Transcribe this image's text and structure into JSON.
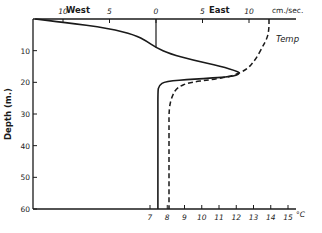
{
  "chart_data": {
    "type": "line",
    "title": "",
    "ylabel": "Depth (m.)",
    "ylim": [
      0,
      60
    ],
    "y_ticks": [
      10,
      20,
      30,
      40,
      50,
      60
    ],
    "top_axis": {
      "label_left": "West",
      "label_right": "East",
      "units": "cm./sec.",
      "ticks": [
        {
          "value": -10,
          "label": "10"
        },
        {
          "value": -5,
          "label": "5"
        },
        {
          "value": 0,
          "label": "0"
        },
        {
          "value": 5,
          "label": "5"
        },
        {
          "value": 10,
          "label": "10"
        }
      ],
      "range": [
        -13,
        15
      ]
    },
    "bottom_axis": {
      "units": "°C",
      "ticks": [
        7,
        8,
        9,
        10,
        11,
        12,
        13,
        14,
        15
      ],
      "range": [
        6.65,
        15.2
      ]
    },
    "series": [
      {
        "name": "Velocity",
        "axis": "top",
        "style": "solid",
        "points": [
          [
            -13.0,
            0
          ],
          [
            -10.0,
            1
          ],
          [
            -5.0,
            3
          ],
          [
            -2.3,
            5
          ],
          [
            -1.0,
            7
          ],
          [
            0.0,
            9
          ],
          [
            1.5,
            11
          ],
          [
            4.0,
            13
          ],
          [
            7.0,
            15
          ],
          [
            8.8,
            16.5
          ],
          [
            9.0,
            17.3
          ],
          [
            8.2,
            18.2
          ],
          [
            4.0,
            19
          ],
          [
            1.0,
            19.7
          ],
          [
            0.3,
            21
          ],
          [
            0.2,
            23
          ],
          [
            0.2,
            30
          ],
          [
            0.2,
            60
          ]
        ]
      },
      {
        "name": "Temp",
        "axis": "bottom",
        "style": "dashed",
        "points": [
          [
            13.9,
            0
          ],
          [
            13.9,
            3
          ],
          [
            13.8,
            6
          ],
          [
            13.5,
            9
          ],
          [
            13.1,
            13
          ],
          [
            12.6,
            16
          ],
          [
            11.8,
            18
          ],
          [
            10.5,
            19.2
          ],
          [
            9.3,
            20
          ],
          [
            8.6,
            21.5
          ],
          [
            8.3,
            24
          ],
          [
            8.1,
            28
          ],
          [
            8.1,
            35
          ],
          [
            8.1,
            60
          ]
        ]
      }
    ],
    "annotations": [
      {
        "text": "Temp",
        "x_temp": 14.1,
        "depth": 6.5
      }
    ]
  }
}
